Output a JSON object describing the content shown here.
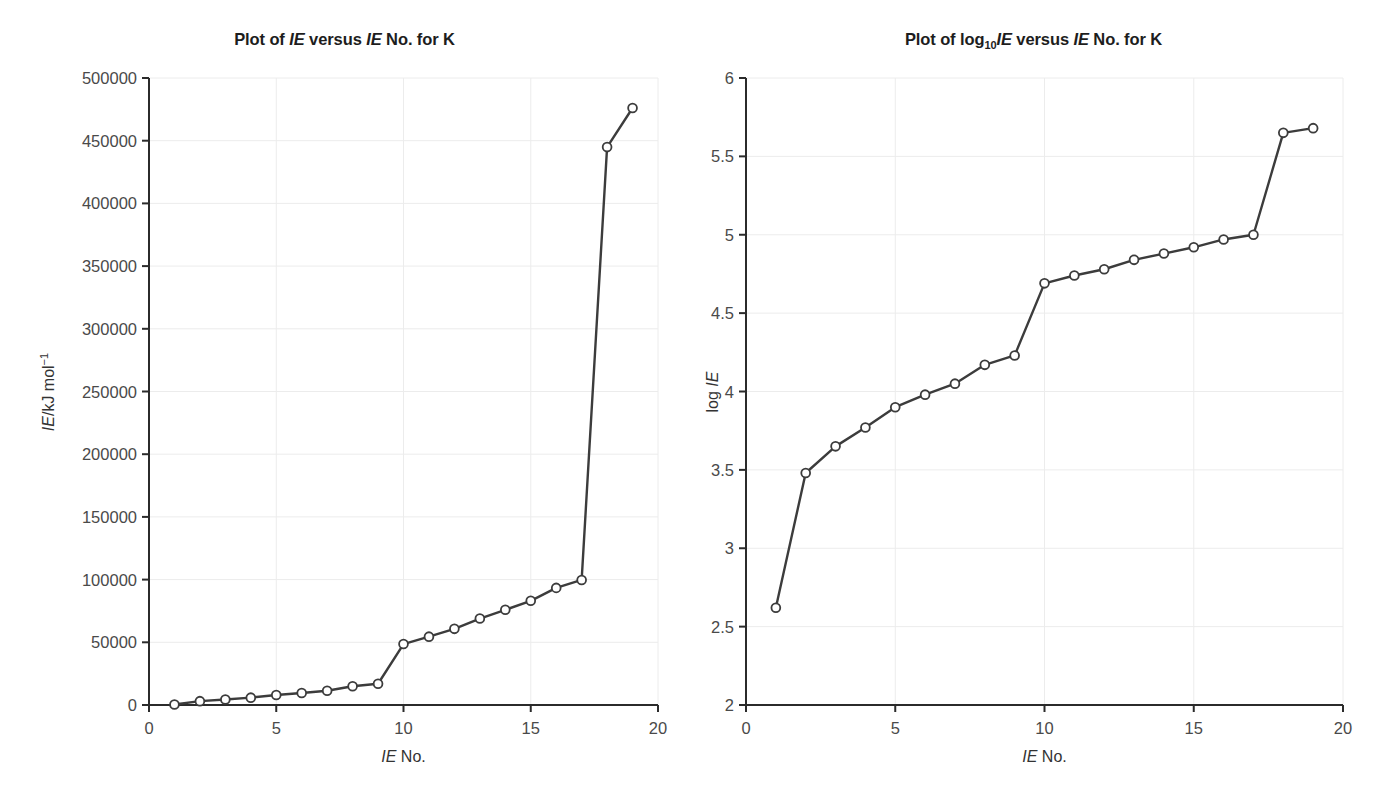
{
  "figure": {
    "background": "#ffffff",
    "line_color": "#3c3c3c",
    "marker_fill": "#ffffff",
    "marker_stroke": "#3c3c3c",
    "grid_color": "#ececec",
    "axis_color": "#2b2b2b",
    "text_color": "#333333"
  },
  "charts": [
    {
      "id": "ie-linear",
      "title_html": "Plot of <i>IE</i> versus <i>IE</i> No. for K",
      "ylabel_html": "<i>IE</i>/kJ mol<sup>&minus;1</sup>",
      "xlabel_html": "<i>IE</i> No.",
      "xticks": [
        "0",
        "5",
        "10",
        "15",
        "20"
      ],
      "yticks": [
        "0",
        "50000",
        "100000",
        "150000",
        "200000",
        "250000",
        "300000",
        "350000",
        "400000",
        "450000",
        "500000"
      ]
    },
    {
      "id": "ie-log",
      "title_html": "Plot of log<sub>10</sub><i>IE</i> versus <i>IE</i> No. for K",
      "ylabel_html": "log <i>IE</i>",
      "xlabel_html": "<i>IE</i> No.",
      "xticks": [
        "0",
        "5",
        "10",
        "15",
        "20"
      ],
      "yticks": [
        "2",
        "2.5",
        "3",
        "3.5",
        "4",
        "4.5",
        "5",
        "5.5",
        "6"
      ]
    }
  ],
  "chart_data": [
    {
      "type": "line",
      "title": "Plot of IE versus IE No. for K",
      "xlabel": "IE No.",
      "ylabel": "IE/kJ mol^-1",
      "xlim": [
        0,
        20
      ],
      "ylim": [
        0,
        500000
      ],
      "xticks": [
        0,
        5,
        10,
        15,
        20
      ],
      "yticks": [
        0,
        50000,
        100000,
        150000,
        200000,
        250000,
        300000,
        350000,
        400000,
        450000,
        500000
      ],
      "grid": true,
      "legend": "none",
      "markers": "open-circle",
      "x": [
        1,
        2,
        3,
        4,
        5,
        6,
        7,
        8,
        9,
        10,
        11,
        12,
        13,
        14,
        15,
        16,
        17,
        18,
        19
      ],
      "values": [
        419,
        3052,
        4420,
        5877,
        7975,
        9590,
        11343,
        14944,
        16964,
        48610,
        54490,
        60730,
        68950,
        75900,
        83080,
        93400,
        99710,
        444880,
        476060
      ]
    },
    {
      "type": "line",
      "title": "Plot of log10 IE versus IE No. for K",
      "xlabel": "IE No.",
      "ylabel": "log IE",
      "xlim": [
        0,
        20
      ],
      "ylim": [
        2,
        6
      ],
      "xticks": [
        0,
        5,
        10,
        15,
        20
      ],
      "yticks": [
        2,
        2.5,
        3,
        3.5,
        4,
        4.5,
        5,
        5.5,
        6
      ],
      "grid": true,
      "legend": "none",
      "markers": "open-circle",
      "x": [
        1,
        2,
        3,
        4,
        5,
        6,
        7,
        8,
        9,
        10,
        11,
        12,
        13,
        14,
        15,
        16,
        17,
        18,
        19
      ],
      "values": [
        2.62,
        3.48,
        3.65,
        3.77,
        3.9,
        3.98,
        4.05,
        4.17,
        4.23,
        4.69,
        4.74,
        4.78,
        4.84,
        4.88,
        4.92,
        4.97,
        5.0,
        5.65,
        5.68
      ]
    }
  ]
}
